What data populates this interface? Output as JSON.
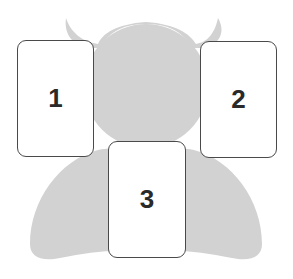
{
  "diagram": {
    "type": "tarot-spread-layout",
    "silhouette": {
      "shape": "horned-figure",
      "color": "#d2d2d2"
    },
    "cards": [
      {
        "position": 1,
        "label": "1"
      },
      {
        "position": 2,
        "label": "2"
      },
      {
        "position": 3,
        "label": "3"
      }
    ],
    "colors": {
      "card_fill": "#ffffff",
      "card_border": "#4a4a4a",
      "label": "#2a2a2a",
      "background": "#ffffff"
    }
  }
}
